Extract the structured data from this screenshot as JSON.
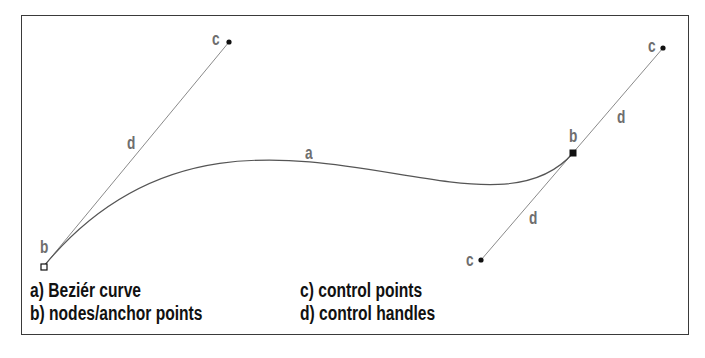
{
  "diagram": {
    "colors": {
      "frame": "#3a3a3a",
      "curve": "#555555",
      "handle": "#8a8a8a",
      "label": "#6e6e6e",
      "legend": "#111111"
    },
    "curve": {
      "label": "a",
      "start_anchor": {
        "x": 44,
        "y": 266
      },
      "control_1": {
        "x": 229,
        "y": 42
      },
      "control_2": {
        "x": 481,
        "y": 260
      },
      "end_anchor": {
        "x": 573,
        "y": 153
      }
    },
    "extra_control": {
      "x": 663,
      "y": 48
    },
    "labels": {
      "a": "a",
      "b_start": "b",
      "b_end": "b",
      "c_top_left": "c",
      "c_top_right": "c",
      "c_bottom": "c",
      "d_left": "d",
      "d_right_upper": "d",
      "d_right_lower": "d"
    },
    "legend": {
      "a": "a) Beziér curve",
      "b": "b) nodes/anchor points",
      "c": "c) control points",
      "d": "d) control handles"
    }
  }
}
